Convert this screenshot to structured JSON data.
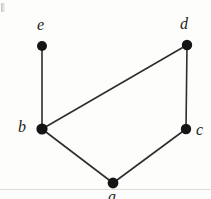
{
  "figure": {
    "kind": "undirected-graph-diagram",
    "width": 211,
    "height": 199,
    "background_color": "#fdfdfc",
    "ink_color": "#151515",
    "edge_color": "#2e2e2e"
  },
  "graph": {
    "vertex_count": 5,
    "edge_count": 5,
    "vertices": [
      {
        "id": "e",
        "label": "e",
        "cx": 42,
        "cy": 46,
        "r": 5.0,
        "label_x": 37,
        "label_y": 17,
        "label_anchor": "above"
      },
      {
        "id": "d",
        "label": "d",
        "cx": 187,
        "cy": 45,
        "r": 5.2,
        "label_x": 180,
        "label_y": 16,
        "label_anchor": "above"
      },
      {
        "id": "b",
        "label": "b",
        "cx": 42,
        "cy": 129,
        "r": 5.6,
        "label_x": 18,
        "label_y": 119,
        "label_anchor": "left"
      },
      {
        "id": "c",
        "label": "c",
        "cx": 186,
        "cy": 129,
        "r": 5.2,
        "label_x": 196,
        "label_y": 122,
        "label_anchor": "right"
      },
      {
        "id": "a",
        "label": "a",
        "cx": 113,
        "cy": 183,
        "r": 5.4,
        "label_x": 108,
        "label_y": 189,
        "label_anchor": "below"
      }
    ],
    "edges": [
      {
        "id": "e-b",
        "from": "e",
        "to": "b"
      },
      {
        "id": "b-d",
        "from": "b",
        "to": "d"
      },
      {
        "id": "d-c",
        "from": "d",
        "to": "c"
      },
      {
        "id": "b-a",
        "from": "b",
        "to": "a"
      },
      {
        "id": "a-c",
        "from": "a",
        "to": "c"
      }
    ]
  },
  "artifacts": {
    "corner_mark_visible": true,
    "baseline_rule_visible": true
  }
}
